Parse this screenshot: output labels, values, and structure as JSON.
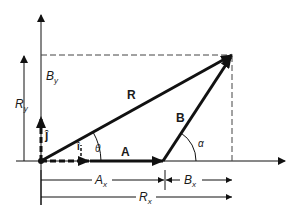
{
  "diagram": {
    "colors": {
      "ink": "#111111",
      "dashed": "#444444",
      "background": "#ffffff"
    },
    "labels": {
      "R": "R",
      "A": "A",
      "B": "B",
      "theta": "θ",
      "alpha": "α",
      "j_hat": "ĵ",
      "i_hat": "î",
      "By": "B",
      "By_sub": "y",
      "Ry": "R",
      "Ry_sub": "y",
      "Ax": "A",
      "Ax_sub": "x",
      "Bx": "B",
      "Bx_sub": "x",
      "Rx": "R",
      "Rx_sub": "x"
    }
  }
}
